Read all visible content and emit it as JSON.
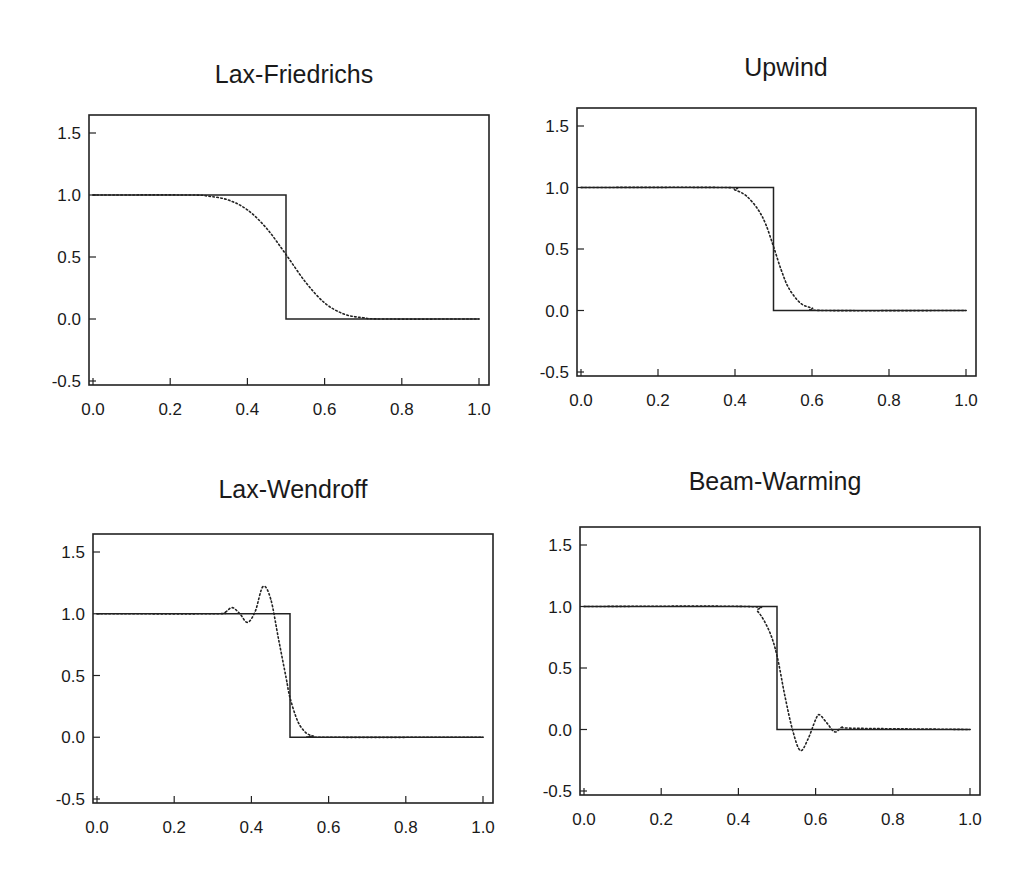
{
  "figure": {
    "panels": [
      {
        "id": "lax-friedrichs",
        "title": "Lax-Friedrichs"
      },
      {
        "id": "upwind",
        "title": "Upwind"
      },
      {
        "id": "lax-wendroff",
        "title": "Lax-Wendroff"
      },
      {
        "id": "beam-warming",
        "title": "Beam-Warming"
      }
    ]
  },
  "chart_data": [
    {
      "type": "line",
      "title": "Lax-Friedrichs",
      "xlabel": "",
      "ylabel": "",
      "xlim": [
        0.0,
        1.0
      ],
      "ylim": [
        -0.5,
        1.5
      ],
      "xticks": [
        "0.0",
        "0.2",
        "0.4",
        "0.6",
        "0.8",
        "1.0"
      ],
      "yticks": [
        "-0.5",
        "0.0",
        "0.5",
        "1.0",
        "1.5"
      ],
      "grid": false,
      "series": [
        {
          "name": "exact",
          "style": "solid",
          "x": [
            0.0,
            0.5,
            0.5,
            1.0
          ],
          "y": [
            1.0,
            1.0,
            0.0,
            0.0
          ]
        },
        {
          "name": "numerical",
          "style": "dotted",
          "x": [
            0.0,
            0.25,
            0.3,
            0.35,
            0.4,
            0.45,
            0.5,
            0.55,
            0.6,
            0.65,
            0.7,
            0.75,
            1.0
          ],
          "y": [
            1.0,
            1.0,
            0.99,
            0.96,
            0.88,
            0.73,
            0.52,
            0.3,
            0.13,
            0.04,
            0.01,
            0.0,
            0.0
          ]
        }
      ]
    },
    {
      "type": "line",
      "title": "Upwind",
      "xlabel": "",
      "ylabel": "",
      "xlim": [
        0.0,
        1.0
      ],
      "ylim": [
        -0.5,
        1.5
      ],
      "xticks": [
        "0.0",
        "0.2",
        "0.4",
        "0.6",
        "0.8",
        "1.0"
      ],
      "yticks": [
        "-0.5",
        "0.0",
        "0.5",
        "1.0",
        "1.5"
      ],
      "grid": false,
      "series": [
        {
          "name": "exact",
          "style": "solid",
          "x": [
            0.0,
            0.5,
            0.5,
            1.0
          ],
          "y": [
            1.0,
            1.0,
            0.0,
            0.0
          ]
        },
        {
          "name": "numerical",
          "style": "dotted",
          "x": [
            0.0,
            0.37,
            0.4,
            0.43,
            0.46,
            0.48,
            0.5,
            0.52,
            0.54,
            0.57,
            0.6,
            0.63,
            1.0
          ],
          "y": [
            1.0,
            1.0,
            0.98,
            0.93,
            0.82,
            0.7,
            0.52,
            0.33,
            0.18,
            0.06,
            0.02,
            0.0,
            0.0
          ]
        }
      ]
    },
    {
      "type": "line",
      "title": "Lax-Wendroff",
      "xlabel": "",
      "ylabel": "",
      "xlim": [
        0.0,
        1.0
      ],
      "ylim": [
        -0.5,
        1.5
      ],
      "xticks": [
        "0.0",
        "0.2",
        "0.4",
        "0.6",
        "0.8",
        "1.0"
      ],
      "yticks": [
        "-0.5",
        "0.0",
        "0.5",
        "1.0",
        "1.5"
      ],
      "grid": false,
      "series": [
        {
          "name": "exact",
          "style": "solid",
          "x": [
            0.0,
            0.5,
            0.5,
            1.0
          ],
          "y": [
            1.0,
            1.0,
            0.0,
            0.0
          ]
        },
        {
          "name": "numerical",
          "style": "dotted",
          "x": [
            0.0,
            0.3,
            0.33,
            0.35,
            0.37,
            0.39,
            0.41,
            0.43,
            0.45,
            0.47,
            0.49,
            0.5,
            0.52,
            0.54,
            0.56,
            0.58,
            1.0
          ],
          "y": [
            1.0,
            1.0,
            1.01,
            1.05,
            1.0,
            0.93,
            1.02,
            1.22,
            1.12,
            0.8,
            0.48,
            0.32,
            0.13,
            0.04,
            0.01,
            0.0,
            0.0
          ]
        }
      ]
    },
    {
      "type": "line",
      "title": "Beam-Warming",
      "xlabel": "",
      "ylabel": "",
      "xlim": [
        0.0,
        1.0
      ],
      "ylim": [
        -0.5,
        1.5
      ],
      "xticks": [
        "0.0",
        "0.2",
        "0.4",
        "0.6",
        "0.8",
        "1.0"
      ],
      "yticks": [
        "-0.5",
        "0.0",
        "0.5",
        "1.0",
        "1.5"
      ],
      "grid": false,
      "series": [
        {
          "name": "exact",
          "style": "solid",
          "x": [
            0.0,
            0.5,
            0.5,
            1.0
          ],
          "y": [
            1.0,
            1.0,
            0.0,
            0.0
          ]
        },
        {
          "name": "numerical",
          "style": "dotted",
          "x": [
            0.0,
            0.42,
            0.45,
            0.48,
            0.5,
            0.52,
            0.54,
            0.56,
            0.58,
            0.6,
            0.61,
            0.63,
            0.65,
            0.67,
            0.7,
            1.0
          ],
          "y": [
            1.0,
            1.0,
            0.96,
            0.8,
            0.6,
            0.28,
            0.0,
            -0.17,
            -0.08,
            0.08,
            0.12,
            0.05,
            -0.02,
            0.02,
            0.01,
            0.0
          ]
        }
      ]
    }
  ]
}
